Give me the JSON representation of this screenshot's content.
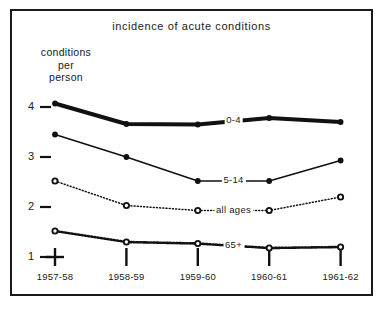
{
  "figure": {
    "title": "incidence of acute conditions",
    "y_axis_title_lines": [
      "conditions",
      "per",
      "person"
    ],
    "frame_color": "#1a1a1a",
    "background": "#ffffff"
  },
  "chart_data": {
    "type": "line",
    "title": "incidence of acute conditions",
    "xlabel": "",
    "ylabel": "conditions per person",
    "categories": [
      "1957-58",
      "1958-59",
      "1959-60",
      "1960-61",
      "1961-62"
    ],
    "ylim": [
      1,
      4.35
    ],
    "yticks": [
      1,
      2,
      3,
      4
    ],
    "ytick_labels": [
      "1",
      "2",
      "3",
      "4"
    ],
    "grid": false,
    "legend": "inline-labels",
    "series": [
      {
        "name": "0-4",
        "values": [
          4.07,
          3.66,
          3.65,
          3.78,
          3.7
        ],
        "style": "solid-thick",
        "marker": "filled-circle",
        "color": "#111111",
        "label_at_index": 2
      },
      {
        "name": "5-14",
        "values": [
          3.45,
          3.0,
          2.52,
          2.52,
          2.93
        ],
        "style": "solid-thin",
        "marker": "filled-circle",
        "color": "#111111",
        "label_at_index": 2
      },
      {
        "name": "all ages",
        "values": [
          2.52,
          2.03,
          1.93,
          1.93,
          2.2
        ],
        "style": "dotted-fine",
        "marker": "open-circle",
        "color": "#111111",
        "label_at_index": 2
      },
      {
        "name": "65+",
        "values": [
          1.52,
          1.3,
          1.27,
          1.18,
          1.2
        ],
        "style": "dotted-bold",
        "marker": "open-circle",
        "color": "#111111",
        "label_at_index": 2
      }
    ]
  }
}
